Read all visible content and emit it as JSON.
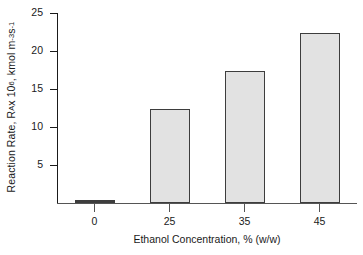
{
  "chart_data": {
    "type": "bar",
    "title": "",
    "subtitle": "",
    "categories": [
      "0",
      "25",
      "35",
      "45"
    ],
    "values": [
      0.1,
      12.4,
      17.4,
      22.4
    ],
    "xlabel": "Ethanol Concentration, % (w/w)",
    "ylabel_parts": {
      "prefix": "Reaction Rate, R",
      "sub": "A",
      "mid": " x 10",
      "sup1": "6",
      "unit_prefix": ", kmol m",
      "sup2": "-3",
      "unit_mid": " s",
      "sup3": "-1"
    },
    "ylabel_plain": "Reaction Rate, RA x 10^6, kmol m^-3 s^-1",
    "ytick_labels": [
      "25",
      "20",
      "15",
      "10",
      "5"
    ],
    "ytick_values": [
      25,
      20,
      15,
      10,
      5
    ],
    "ylim": [
      0,
      25
    ],
    "grid": false,
    "legend": false,
    "legend_position": "none",
    "colors": {
      "bar_fill": "#e2e2e2",
      "bar_border": "#3d3d3d",
      "axis": "#1a1a1a",
      "background": "#ffffff"
    }
  }
}
